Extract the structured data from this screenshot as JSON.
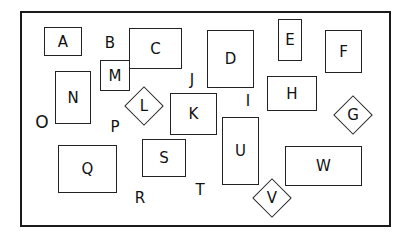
{
  "diagram": {
    "boxes": {
      "A": {
        "label": "A"
      },
      "C": {
        "label": "C"
      },
      "D": {
        "label": "D"
      },
      "E": {
        "label": "E"
      },
      "F": {
        "label": "F"
      },
      "H": {
        "label": "H"
      },
      "K": {
        "label": "K"
      },
      "M": {
        "label": "M"
      },
      "N": {
        "label": "N"
      },
      "Q": {
        "label": "Q"
      },
      "S": {
        "label": "S"
      },
      "U": {
        "label": "U"
      },
      "W": {
        "label": "W"
      }
    },
    "diamonds": {
      "G": {
        "label": "G"
      },
      "L": {
        "label": "L"
      },
      "V": {
        "label": "V"
      }
    },
    "free_letters": {
      "B": {
        "label": "B"
      },
      "I": {
        "label": "I"
      },
      "J": {
        "label": "J"
      },
      "O": {
        "label": "O"
      },
      "P": {
        "label": "P"
      },
      "R": {
        "label": "R"
      },
      "T": {
        "label": "T"
      }
    }
  }
}
